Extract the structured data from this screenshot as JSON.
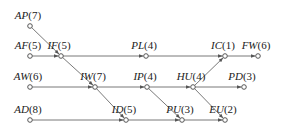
{
  "diagram": {
    "type": "activity-network",
    "nodes": [
      {
        "id": "AP",
        "duration": "7",
        "x": 30,
        "y": 26
      },
      {
        "id": "AF",
        "duration": "5",
        "x": 30,
        "y": 56
      },
      {
        "id": "IF",
        "duration": "5",
        "x": 61,
        "y": 56
      },
      {
        "id": "PL",
        "duration": "4",
        "x": 146,
        "y": 56
      },
      {
        "id": "IC",
        "duration": "1",
        "x": 225,
        "y": 56
      },
      {
        "id": "FW",
        "duration": "6",
        "x": 258,
        "y": 56
      },
      {
        "id": "AW",
        "duration": "6",
        "x": 30,
        "y": 87
      },
      {
        "id": "IW",
        "duration": "7",
        "x": 95,
        "y": 87
      },
      {
        "id": "IP",
        "duration": "4",
        "x": 147,
        "y": 87
      },
      {
        "id": "HU",
        "duration": "4",
        "x": 193,
        "y": 87
      },
      {
        "id": "PD",
        "duration": "3",
        "x": 244,
        "y": 87
      },
      {
        "id": "AD",
        "duration": "8",
        "x": 30,
        "y": 120
      },
      {
        "id": "ID",
        "duration": "5",
        "x": 126,
        "y": 120
      },
      {
        "id": "PU",
        "duration": "3",
        "x": 182,
        "y": 120
      },
      {
        "id": "EU",
        "duration": "2",
        "x": 225,
        "y": 120
      }
    ],
    "edges": [
      [
        "AP",
        "IF"
      ],
      [
        "AF",
        "IF"
      ],
      [
        "IF",
        "PL"
      ],
      [
        "PL",
        "IC"
      ],
      [
        "IC",
        "FW"
      ],
      [
        "IF",
        "IW"
      ],
      [
        "AW",
        "IW"
      ],
      [
        "IW",
        "IP"
      ],
      [
        "IW",
        "ID"
      ],
      [
        "IP",
        "HU"
      ],
      [
        "IP",
        "PU"
      ],
      [
        "HU",
        "IC"
      ],
      [
        "HU",
        "PD"
      ],
      [
        "HU",
        "EU"
      ],
      [
        "AD",
        "ID"
      ],
      [
        "ID",
        "PU"
      ],
      [
        "PU",
        "EU"
      ]
    ]
  }
}
